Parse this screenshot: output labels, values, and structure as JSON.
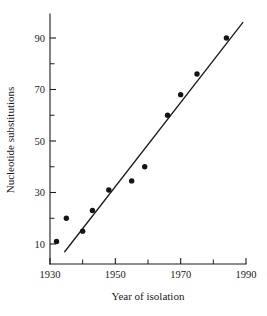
{
  "chart_data": {
    "type": "scatter",
    "title": "",
    "xlabel": "Year of isolation",
    "ylabel": "Nucleotide substitutions",
    "xlim": [
      1930,
      1990
    ],
    "ylim": [
      6,
      98
    ],
    "grid": false,
    "legend": "none",
    "x_ticks_major": [
      1930,
      1950,
      1970,
      1990
    ],
    "x_ticks_major_labels": [
      "1930",
      "1950",
      "1970",
      "1990"
    ],
    "x_ticks_minor": [
      1940,
      1960,
      1980
    ],
    "y_ticks_major": [
      10,
      30,
      50,
      70,
      90
    ],
    "y_ticks_major_labels": [
      "10",
      "30",
      "50",
      "70",
      "90"
    ],
    "y_ticks_minor": [
      20,
      40,
      60,
      80
    ],
    "x": [
      1932,
      1935,
      1940,
      1943,
      1948,
      1955,
      1959,
      1966,
      1970,
      1975,
      1984
    ],
    "y": [
      11,
      20,
      15,
      23,
      31,
      34.5,
      40,
      60,
      68,
      76,
      90
    ],
    "points": [
      {
        "x": 1932,
        "y": 11
      },
      {
        "x": 1935,
        "y": 20
      },
      {
        "x": 1940,
        "y": 15
      },
      {
        "x": 1943,
        "y": 23
      },
      {
        "x": 1948,
        "y": 31
      },
      {
        "x": 1955,
        "y": 34.5
      },
      {
        "x": 1959,
        "y": 40
      },
      {
        "x": 1966,
        "y": 60
      },
      {
        "x": 1970,
        "y": 68
      },
      {
        "x": 1975,
        "y": 76
      },
      {
        "x": 1984,
        "y": 90
      }
    ],
    "trend_line": {
      "x_start": 1934.5,
      "y_start": 7,
      "x_end": 1989,
      "y_end": 96
    },
    "marker": "filled-circle",
    "marker_color": "#141414",
    "line_color": "#1d1d1d",
    "background_color": "#ffffff"
  }
}
